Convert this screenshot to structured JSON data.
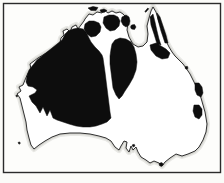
{
  "figure": {
    "type": "distribution-map"
  },
  "colors": {
    "ink": "#0d0d0d",
    "coast_line": "#1b1b1b",
    "land": "#ffffff",
    "paper": "#fbfbf8",
    "scan_halo": "#bfbfb9",
    "frame": "#2b2b2b"
  },
  "map": {
    "viewBox": "0 0 224 183",
    "coastline_d": "M85,19 L89,14 93,15 97,12 102,13 104,10 108,13 112,11 116,13 120,12 123,14 126,17 128,23 127,30 129,37 133,44 138,47 143,46 147,42 148,34 147,26 149,18 151,11 153,7 156,12 158,19 161,27 164,34 166,41 169,47 172,52 175,56 179,60 183,64 186,68 190,74 193,80 196,86 199,92 201,98 203,105 205,112 206,118 207,124 206,132 203,140 199,147 195,151 188,154 182,156 176,154 170,158 165,162 162,166 159,163 154,161 150,163 146,160 141,157 138,152 136,147 133,150 131,146 129,152 126,148 127,142 124,141 121,146 119,150 115,147 111,141 106,138 99,136 90,134 80,133 70,133 60,134 52,137 45,141 39,145 34,149 31,145 29,138 27,130 26,122 24,114 22,106 20,98 17,94 21,91 19,87 23,85 25,80 28,73 31,69 30,64 34,61 38,58 43,55 48,52 53,49 57,46 60,43 61,38 64,35 63,31 67,29 70,32 72,27 76,25 78,29 81,25 84,21 Z",
    "regions": [
      {
        "name": "western-interior-mass",
        "d": "M62,40 L65,34 68,31 73,29 78,28 83,29 86,32 88,36 91,42 95,47 99,51 102,55 103,58 104,65 105,72 106,80 107,88 108,96 109,104 110,112 111,118 107,122 102,124 96,126 90,127 83,127 76,126 69,124 63,122 57,120 53,118 50,110 47,116 43,107 40,113 36,106 32,102 29,96 35,93 37,90 33,87 28,86 26,82 27,76 29,70 33,65 37,60 42,56 47,52 52,48 57,44 Z"
      },
      {
        "name": "central-north-blob",
        "d": "M112,44 L115,40 120,38 126,39 131,42 134,47 136,54 137,62 136,70 133,78 129,85 125,91 122,96 119,99 116,95 113,88 112,80 111,72 110,64 110,56 111,49 Z"
      },
      {
        "name": "top-end-west-patch",
        "d": "M85,24 L89,21 94,21 99,23 101,27 100,32 96,36 91,37 87,34 84,29 Z"
      },
      {
        "name": "top-end-central-patch",
        "d": "M104,17 L109,15 114,15 118,17 120,21 119,26 115,30 110,31 106,28 103,23 Z"
      },
      {
        "name": "top-end-east-patch",
        "d": "M122,17 L126,15 129,17 130,21 129,25 126,27 123,25 121,21 Z"
      },
      {
        "name": "cape-york-stripes",
        "d": "M150,17 L153,14 155,22 157,31 159,39 161,45 157,44 154,34 151,25 Z M157,13 L160,17 163,26 166,35 168,43 165,43 161,31 158,20 Z M150,45 L156,43 161,46 166,49 170,53 168,58 162,59 156,56 151,50 Z"
      },
      {
        "name": "east-coast-north-patch",
        "d": "M195,83 L199,83 202,87 203,93 201,97 197,95 195,90 Z"
      },
      {
        "name": "east-coast-south-patch",
        "d": "M194,105 L199,105 202,109 202,115 199,119 195,117 193,111 Z"
      },
      {
        "name": "islands-and-coastal-marks",
        "d": "M88,8 L93,6.5 98,7.5 96,10.5 91,10.5 Z M100,10 L104,9 107,10.5 104,12.5 101,12 Z M131.5,25 L134.5,24.5 136,27 134.5,29.5 131.5,29 130.5,27 Z M144.8,11.5 L147.8,8 148.8,8.8 145.8,12.3 Z M185.5,66.5 L187.5,66.5 188,68.5 186,69.3 185,68 Z M159,163.5 L161.5,162.5 163.5,164 161.5,166.5 159.5,165.5 Z M18,142.5 L19.6,141.9 20.4,143.3 19,144.3 Z M15.8,95.5 L17.2,95 17.8,96.2 16.6,97 Z M132,145 L134.2,144.2 135,146 133.2,147 Z"
      }
    ],
    "frame": {
      "x": 3.5,
      "y": 3.5,
      "width": 217,
      "height": 169
    }
  }
}
